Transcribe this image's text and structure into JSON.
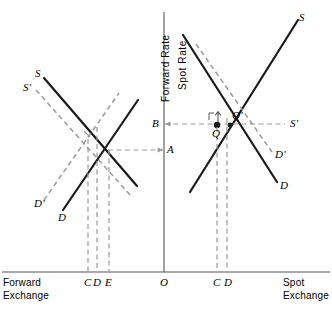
{
  "figure": {
    "title": "",
    "axes": {
      "vertical_left_label": "Forward  Rate",
      "vertical_right_label": "Spot  Rate",
      "origin_label": "O",
      "left_axis_name": "Forward\nExchange",
      "right_axis_name": "Spot\nExchange"
    },
    "left_panel": {
      "curves": [
        {
          "name": "S",
          "label": "S",
          "style": "solid",
          "slope": "down"
        },
        {
          "name": "S-prime",
          "label": "S'",
          "style": "dashed",
          "slope": "down"
        },
        {
          "name": "D",
          "label": "D",
          "style": "solid",
          "slope": "up"
        },
        {
          "name": "D-prime",
          "label": "D'",
          "style": "dashed",
          "slope": "up"
        }
      ],
      "x_ticks": [
        "C",
        "D",
        "E"
      ],
      "y_ticks": [
        "A"
      ]
    },
    "right_panel": {
      "curves": [
        {
          "name": "S",
          "label": "S",
          "style": "solid",
          "slope": "up"
        },
        {
          "name": "S-prime",
          "label": "S'",
          "style": "dashed",
          "slope": "flat"
        },
        {
          "name": "D",
          "label": "D",
          "style": "solid",
          "slope": "down"
        },
        {
          "name": "D-prime",
          "label": "D'",
          "style": "dashed",
          "slope": "down"
        }
      ],
      "points": [
        {
          "name": "Q",
          "label": "Q"
        },
        {
          "name": "Q-prime",
          "label": "Q'"
        }
      ],
      "x_ticks": [
        "C",
        "D"
      ],
      "y_ticks": [
        "B"
      ]
    },
    "colors": {
      "ink": "#1a1a1a",
      "dashed": "#9a9a9a",
      "axis": "#555555",
      "background": "#ffffff"
    }
  }
}
